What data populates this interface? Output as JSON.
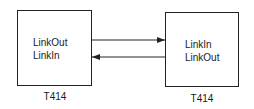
{
  "diagram": {
    "nodes": [
      {
        "id": "left",
        "caption": "T414",
        "ports": [
          "LinkOut",
          "LinkIn"
        ]
      },
      {
        "id": "right",
        "caption": "T414",
        "ports": [
          "LinkIn",
          "LinkOut"
        ]
      }
    ],
    "edges": [
      {
        "from": "left.LinkOut",
        "to": "right.LinkIn",
        "direction": "left-to-right"
      },
      {
        "from": "right.LinkOut",
        "to": "left.LinkIn",
        "direction": "right-to-left"
      }
    ]
  }
}
